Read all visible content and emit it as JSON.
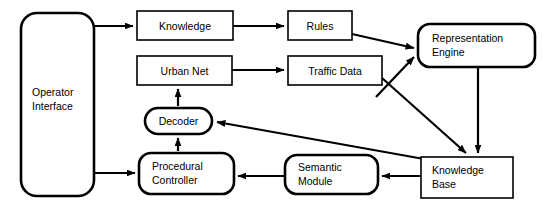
{
  "diagram": {
    "type": "block-flow-diagram",
    "background_color": "#ffffff",
    "stroke_color": "#000000",
    "nodes": [
      {
        "id": "operator-interface",
        "label": "Operator\nInterface",
        "shape": "rounded-rect",
        "x": 21,
        "y": 13,
        "w": 73,
        "h": 183,
        "radius": 16,
        "label_align": "left",
        "label_x": 32,
        "label_y": 85
      },
      {
        "id": "knowledge",
        "label": "Knowledge",
        "shape": "rect",
        "x": 137,
        "y": 11,
        "w": 96,
        "h": 29,
        "radius": 0,
        "label_align": "center",
        "label_x": 137,
        "label_y": 18
      },
      {
        "id": "rules",
        "label": "Rules",
        "shape": "rect",
        "x": 288,
        "y": 11,
        "w": 64,
        "h": 29,
        "radius": 0,
        "label_align": "center",
        "label_x": 288,
        "label_y": 18
      },
      {
        "id": "representation-engine",
        "label": "Representation\nEngine",
        "shape": "rounded-rect",
        "x": 418,
        "y": 24,
        "w": 117,
        "h": 43,
        "radius": 12,
        "label_align": "left",
        "label_x": 432,
        "label_y": 31
      },
      {
        "id": "urban-net",
        "label": "Urban Net",
        "shape": "rect",
        "x": 137,
        "y": 56,
        "w": 95,
        "h": 29,
        "radius": 0,
        "label_align": "center",
        "label_x": 137,
        "label_y": 63
      },
      {
        "id": "traffic-data",
        "label": "Traffic Data",
        "shape": "rect",
        "x": 288,
        "y": 56,
        "w": 94,
        "h": 29,
        "radius": 0,
        "label_align": "center",
        "label_x": 288,
        "label_y": 63
      },
      {
        "id": "decoder",
        "label": "Decoder",
        "shape": "rounded-rect",
        "x": 145,
        "y": 108,
        "w": 67,
        "h": 26,
        "radius": 13,
        "label_align": "center",
        "label_x": 145,
        "label_y": 114
      },
      {
        "id": "procedural-controller",
        "label": "Procedural\nController",
        "shape": "rounded-rect",
        "x": 139,
        "y": 153,
        "w": 95,
        "h": 41,
        "radius": 12,
        "label_align": "left",
        "label_x": 152,
        "label_y": 159
      },
      {
        "id": "semantic-module",
        "label": "Semantic\nModule",
        "shape": "rounded-rect",
        "x": 285,
        "y": 155,
        "w": 93,
        "h": 39,
        "radius": 12,
        "label_align": "left",
        "label_x": 298,
        "label_y": 160
      },
      {
        "id": "knowledge-base",
        "label": "Knowledge\nBase",
        "shape": "rect",
        "x": 421,
        "y": 157,
        "w": 92,
        "h": 41,
        "radius": 0,
        "label_align": "left",
        "label_x": 432,
        "label_y": 163
      }
    ],
    "edges": [
      {
        "id": "operator-to-knowledge",
        "from": "operator-interface",
        "to": "knowledge",
        "path": "M 94 26 L 133 26",
        "arrow": true
      },
      {
        "id": "operator-to-procedural",
        "from": "operator-interface",
        "to": "procedural-controller",
        "path": "M 94 173 L 135 173",
        "arrow": true
      },
      {
        "id": "knowledge-to-rules",
        "from": "knowledge",
        "to": "rules",
        "path": "M 233 26 L 284 26",
        "arrow": true
      },
      {
        "id": "rules-to-representation",
        "from": "rules",
        "to": "representation-engine",
        "path": "M 352 34 L 414 48",
        "arrow": true
      },
      {
        "id": "urban-net-to-traffic-data",
        "from": "urban-net",
        "to": "traffic-data",
        "path": "M 232 70 L 284 70",
        "arrow": true
      },
      {
        "id": "traffic-data-to-representation",
        "from": "traffic-data",
        "to": "representation-engine",
        "path": "M 376 97 L 414 57",
        "arrow": true
      },
      {
        "id": "traffic-data-to-knowledge-base",
        "from": "traffic-data",
        "to": "knowledge-base",
        "path": "M 382 78 L 466 153",
        "arrow": true
      },
      {
        "id": "representation-to-knowledge-base",
        "from": "representation-engine",
        "to": "knowledge-base",
        "path": "M 478 67 L 478 153",
        "arrow": true
      },
      {
        "id": "knowledge-base-to-decoder",
        "from": "knowledge-base",
        "to": "decoder",
        "path": "M 424 159 L 217 122",
        "arrow": true
      },
      {
        "id": "knowledge-base-to-semantic",
        "from": "knowledge-base",
        "to": "semantic-module",
        "path": "M 421 176 L 382 176",
        "arrow": true
      },
      {
        "id": "semantic-to-procedural",
        "from": "semantic-module",
        "to": "procedural-controller",
        "path": "M 285 176 L 238 176",
        "arrow": true
      },
      {
        "id": "procedural-to-decoder",
        "from": "procedural-controller",
        "to": "decoder",
        "path": "M 178 151 L 178 138",
        "arrow": true
      },
      {
        "id": "decoder-to-urban-net",
        "from": "decoder",
        "to": "urban-net",
        "path": "M 178 106 L 178 89",
        "arrow": true
      }
    ]
  }
}
